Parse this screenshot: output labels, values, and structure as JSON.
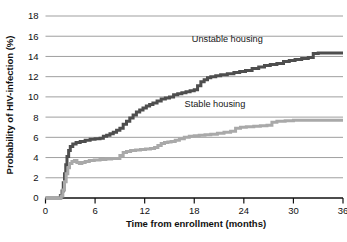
{
  "figure": {
    "background_color": "#ffffff",
    "caption_partial": ""
  },
  "chart_data": {
    "type": "line",
    "title": "",
    "subtitle": "",
    "xlabel": "Time from enrollment (months)",
    "ylabel": "Probability of HIV-infection (%)",
    "xlim": [
      0,
      36
    ],
    "ylim": [
      0,
      18
    ],
    "xticks": [
      0,
      6,
      12,
      18,
      24,
      30,
      36
    ],
    "yticks": [
      0,
      2,
      4,
      6,
      8,
      10,
      12,
      14,
      16,
      18
    ],
    "xtick_labels": [
      "0",
      "6",
      "12",
      "18",
      "24",
      "30",
      "36"
    ],
    "ytick_labels": [
      "0",
      "2",
      "4",
      "6",
      "8",
      "10",
      "12",
      "14",
      "16",
      "18"
    ],
    "grid": "horizontal",
    "grid_color": "#8e8e8e",
    "axis_color": "#111111",
    "legend_position": "inline-annotation",
    "step_shape": "post",
    "series": [
      {
        "name": "Unstable housing",
        "color": "#4e4e4e",
        "line_width": 3.0,
        "label_x": 22.0,
        "label_y": 15.4,
        "points": [
          [
            0.0,
            0.0
          ],
          [
            1.6,
            0.0
          ],
          [
            1.8,
            0.25
          ],
          [
            2.0,
            0.7
          ],
          [
            2.15,
            1.5
          ],
          [
            2.3,
            2.4
          ],
          [
            2.45,
            3.3
          ],
          [
            2.6,
            4.1
          ],
          [
            2.8,
            4.7
          ],
          [
            3.0,
            5.1
          ],
          [
            3.3,
            5.35
          ],
          [
            3.7,
            5.5
          ],
          [
            4.2,
            5.6
          ],
          [
            4.8,
            5.7
          ],
          [
            5.4,
            5.8
          ],
          [
            6.0,
            5.85
          ],
          [
            6.6,
            5.9
          ],
          [
            7.0,
            6.1
          ],
          [
            7.4,
            6.2
          ],
          [
            7.8,
            6.35
          ],
          [
            8.2,
            6.5
          ],
          [
            8.6,
            6.7
          ],
          [
            9.0,
            6.9
          ],
          [
            9.4,
            7.3
          ],
          [
            9.8,
            7.6
          ],
          [
            10.2,
            7.9
          ],
          [
            10.6,
            8.2
          ],
          [
            11.0,
            8.5
          ],
          [
            11.4,
            8.7
          ],
          [
            11.8,
            8.9
          ],
          [
            12.2,
            9.1
          ],
          [
            12.6,
            9.25
          ],
          [
            13.0,
            9.4
          ],
          [
            13.5,
            9.6
          ],
          [
            14.0,
            9.8
          ],
          [
            14.5,
            9.9
          ],
          [
            15.0,
            10.0
          ],
          [
            15.5,
            10.2
          ],
          [
            16.0,
            10.3
          ],
          [
            16.5,
            10.4
          ],
          [
            17.0,
            10.5
          ],
          [
            17.5,
            10.6
          ],
          [
            18.0,
            10.7
          ],
          [
            18.4,
            11.1
          ],
          [
            18.8,
            11.5
          ],
          [
            19.2,
            11.7
          ],
          [
            19.6,
            11.9
          ],
          [
            20.0,
            12.0
          ],
          [
            20.6,
            12.1
          ],
          [
            21.2,
            12.2
          ],
          [
            22.0,
            12.3
          ],
          [
            22.8,
            12.4
          ],
          [
            23.5,
            12.5
          ],
          [
            24.2,
            12.6
          ],
          [
            25.0,
            12.8
          ],
          [
            25.8,
            12.95
          ],
          [
            26.5,
            13.1
          ],
          [
            27.2,
            13.2
          ],
          [
            28.0,
            13.3
          ],
          [
            28.8,
            13.5
          ],
          [
            29.5,
            13.6
          ],
          [
            30.2,
            13.7
          ],
          [
            31.0,
            13.8
          ],
          [
            31.8,
            13.9
          ],
          [
            32.4,
            14.3
          ],
          [
            33.0,
            14.35
          ],
          [
            34.0,
            14.35
          ],
          [
            36.0,
            14.35
          ]
        ]
      },
      {
        "name": "Stable housing",
        "color": "#a9a9a9",
        "line_width": 3.0,
        "label_x": 20.5,
        "label_y": 9.0,
        "points": [
          [
            0.0,
            0.0
          ],
          [
            1.7,
            0.0
          ],
          [
            1.9,
            0.2
          ],
          [
            2.1,
            0.8
          ],
          [
            2.3,
            1.6
          ],
          [
            2.5,
            2.4
          ],
          [
            2.7,
            3.0
          ],
          [
            2.9,
            3.4
          ],
          [
            3.2,
            3.6
          ],
          [
            3.5,
            3.7
          ],
          [
            3.8,
            3.5
          ],
          [
            4.1,
            3.4
          ],
          [
            4.4,
            3.5
          ],
          [
            4.8,
            3.6
          ],
          [
            5.3,
            3.7
          ],
          [
            5.9,
            3.75
          ],
          [
            6.6,
            3.8
          ],
          [
            7.3,
            3.85
          ],
          [
            8.0,
            3.9
          ],
          [
            8.6,
            3.9
          ],
          [
            9.0,
            4.2
          ],
          [
            9.4,
            4.5
          ],
          [
            9.8,
            4.6
          ],
          [
            10.3,
            4.7
          ],
          [
            10.9,
            4.75
          ],
          [
            11.5,
            4.8
          ],
          [
            12.1,
            4.85
          ],
          [
            12.7,
            4.9
          ],
          [
            13.2,
            5.0
          ],
          [
            13.6,
            5.2
          ],
          [
            14.0,
            5.4
          ],
          [
            14.4,
            5.5
          ],
          [
            14.8,
            5.55
          ],
          [
            15.2,
            5.6
          ],
          [
            15.7,
            5.7
          ],
          [
            16.2,
            5.85
          ],
          [
            16.8,
            6.0
          ],
          [
            17.4,
            6.1
          ],
          [
            18.0,
            6.15
          ],
          [
            18.6,
            6.2
          ],
          [
            19.3,
            6.25
          ],
          [
            20.0,
            6.3
          ],
          [
            20.8,
            6.4
          ],
          [
            21.6,
            6.5
          ],
          [
            22.4,
            6.6
          ],
          [
            23.0,
            6.9
          ],
          [
            23.6,
            7.0
          ],
          [
            24.3,
            7.05
          ],
          [
            25.2,
            7.1
          ],
          [
            26.0,
            7.15
          ],
          [
            26.8,
            7.2
          ],
          [
            27.4,
            7.5
          ],
          [
            28.0,
            7.6
          ],
          [
            29.0,
            7.65
          ],
          [
            30.0,
            7.7
          ],
          [
            31.5,
            7.7
          ],
          [
            33.0,
            7.7
          ],
          [
            36.0,
            7.7
          ]
        ]
      }
    ]
  }
}
